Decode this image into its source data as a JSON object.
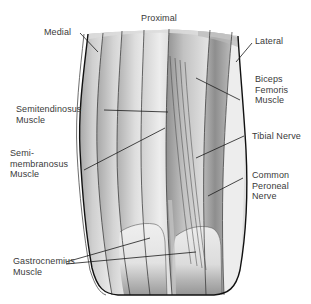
{
  "figure": {
    "background_color": "#ffffff",
    "label_color": "#3a3a3a",
    "leader_line_color": "#1a1a1a",
    "outline_color": "#111111"
  },
  "orientation_labels": {
    "proximal": "Proximal",
    "medial": "Medial",
    "lateral": "Lateral"
  },
  "structures": {
    "semitendinosus": "Semitendinosus\nMuscle",
    "semimembranosus": "Semi-\nmembranosus\nMuscle",
    "gastrocnemius": "Gastrocnemius\nMuscle",
    "biceps_femoris": "Biceps\nFemoris\nMuscle",
    "tibial_nerve": "Tibial Nerve",
    "common_peroneal_nerve": "Common\nPeroneal\nNerve"
  },
  "palette": {
    "muscle_light": "#e9e9e9",
    "muscle_mid": "#c9c9c9",
    "muscle_dark": "#a5a5a5",
    "muscle_deep": "#8a8a8a",
    "tendon": "#f0f0f0",
    "shadow": "#7d7d7d"
  }
}
